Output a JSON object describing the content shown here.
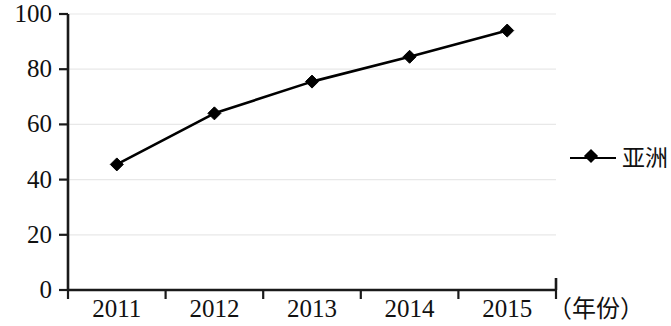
{
  "chart_data": {
    "type": "line",
    "title": "",
    "subtitle": "",
    "xlabel": "（年份）",
    "ylabel": "",
    "categories": [
      "2011",
      "2012",
      "2013",
      "2014",
      "2015"
    ],
    "series": [
      {
        "name": "亚洲",
        "values": [
          45.5,
          64,
          75.5,
          84.5,
          94
        ],
        "color": "#000000",
        "marker": "diamond"
      }
    ],
    "ylim": [
      0,
      100
    ],
    "yticks": [
      "0",
      "20",
      "40",
      "60",
      "80",
      "100"
    ],
    "ytick_values": [
      0,
      20,
      40,
      60,
      80,
      100
    ],
    "grid": {
      "horizontal": true,
      "vertical": false,
      "color": "#e8e8e8"
    },
    "legend": {
      "position": "right",
      "entries": [
        {
          "label": "亚洲",
          "marker": "diamond",
          "color": "#000000"
        }
      ]
    },
    "axis": {
      "color": "#1a1a1a",
      "left_spine": true,
      "bottom_spine": true,
      "ticks_outward": true
    }
  }
}
